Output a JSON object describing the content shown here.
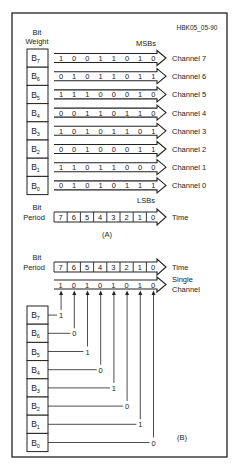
{
  "figure_id": "HBK05_05-90",
  "panel_a": {
    "label": "(A)",
    "bit_weight_label": [
      "Bit",
      "Weight"
    ],
    "msb_label": "MSBs",
    "lsb_label": "LSBs",
    "rows": [
      {
        "weight": "B",
        "sub": "7",
        "bits": [
          "1",
          "0",
          "0",
          "1",
          "1",
          "0",
          "1",
          "0"
        ],
        "channel": "Channel 7"
      },
      {
        "weight": "B",
        "sub": "6",
        "bits": [
          "0",
          "1",
          "0",
          "1",
          "1",
          "0",
          "1",
          "1"
        ],
        "channel": "Channel 6"
      },
      {
        "weight": "B",
        "sub": "5",
        "bits": [
          "1",
          "1",
          "1",
          "0",
          "0",
          "0",
          "1",
          "0"
        ],
        "channel": "Channel 5"
      },
      {
        "weight": "B",
        "sub": "4",
        "bits": [
          "0",
          "0",
          "1",
          "1",
          "0",
          "1",
          "1",
          "0"
        ],
        "channel": "Channel 4"
      },
      {
        "weight": "B",
        "sub": "3",
        "bits": [
          "1",
          "0",
          "1",
          "0",
          "1",
          "1",
          "0",
          "1"
        ],
        "channel": "Channel 3"
      },
      {
        "weight": "B",
        "sub": "2",
        "bits": [
          "0",
          "0",
          "1",
          "0",
          "0",
          "0",
          "1",
          "1"
        ],
        "channel": "Channel 2"
      },
      {
        "weight": "B",
        "sub": "1",
        "bits": [
          "1",
          "1",
          "0",
          "1",
          "1",
          "0",
          "0",
          "0"
        ],
        "channel": "Channel 1"
      },
      {
        "weight": "B",
        "sub": "0",
        "bits": [
          "0",
          "1",
          "0",
          "1",
          "0",
          "1",
          "1",
          "1"
        ],
        "channel": "Channel 0"
      }
    ],
    "bit_period_label": [
      "Bit",
      "Period"
    ],
    "periods": [
      "7",
      "6",
      "5",
      "4",
      "3",
      "2",
      "1",
      "0"
    ],
    "time_label": "Time"
  },
  "panel_b": {
    "label": "(B)",
    "bit_period_label": [
      "Bit",
      "Period"
    ],
    "periods": [
      "7",
      "6",
      "5",
      "4",
      "3",
      "2",
      "1",
      "0"
    ],
    "time_label": "Time",
    "single_channel_bits": [
      "1",
      "0",
      "1",
      "0",
      "1",
      "0",
      "1",
      "0"
    ],
    "single_channel_label": [
      "Single",
      "Channel"
    ],
    "weights": [
      {
        "weight": "B",
        "sub": "7",
        "value": "1"
      },
      {
        "weight": "B",
        "sub": "6",
        "value": "0"
      },
      {
        "weight": "B",
        "sub": "5",
        "value": "1"
      },
      {
        "weight": "B",
        "sub": "4",
        "value": "0"
      },
      {
        "weight": "B",
        "sub": "3",
        "value": "1"
      },
      {
        "weight": "B",
        "sub": "2",
        "value": "0"
      },
      {
        "weight": "B",
        "sub": "1",
        "value": "1"
      },
      {
        "weight": "B",
        "sub": "0",
        "value": "0"
      }
    ]
  },
  "colors": {
    "line": "#222222",
    "box_fill": "#ffffff",
    "text": "#222222"
  }
}
